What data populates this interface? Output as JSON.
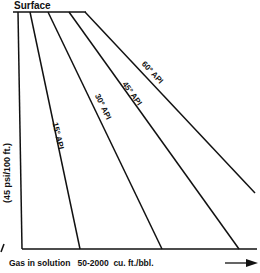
{
  "diagram": {
    "surface_label": "Surface",
    "y_axis_label": "(45 psi/100 ft.)",
    "x_axis_label": "Gas in solution   50-2000  cu. ft./bbl.",
    "arrow_icon": "right-arrow",
    "curves": [
      {
        "label": "15° API",
        "x1": 30,
        "y1": 12,
        "x2": 80,
        "y2": 249
      },
      {
        "label": "30° API",
        "x1": 48,
        "y1": 12,
        "x2": 162,
        "y2": 249
      },
      {
        "label": "45° API",
        "x1": 69,
        "y1": 12,
        "x2": 239,
        "y2": 249
      },
      {
        "label": "60° API",
        "x1": 85,
        "y1": 12,
        "x2": 255,
        "y2": 193
      }
    ],
    "line_color": "#111111"
  }
}
